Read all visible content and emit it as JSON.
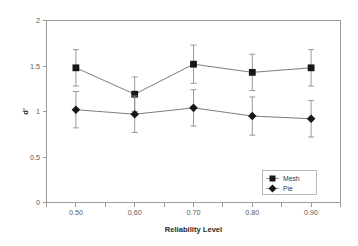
{
  "chart_data": {
    "type": "line",
    "title": "",
    "subtitle": "",
    "xlabel": "Reliability Level",
    "ylabel": "d'",
    "categories": [
      "0.50",
      "0.60",
      "0.70",
      "0.80",
      "0.90"
    ],
    "x": [
      0.5,
      0.6,
      0.7,
      0.8,
      0.9
    ],
    "xlim": [
      0.45,
      0.95
    ],
    "ylim": [
      0,
      2
    ],
    "yticks": [
      "0",
      "0.5",
      "1",
      "1.5",
      "2"
    ],
    "ytick_values": [
      0,
      0.5,
      1,
      1.5,
      2
    ],
    "xticks": [
      "0.50",
      "0.60",
      "0.70",
      "0.80",
      "0.90"
    ],
    "grid": false,
    "legend_position": "bottom-right",
    "error_bars": "symmetric standard error",
    "series": [
      {
        "name": "Mesh",
        "marker": "square",
        "values": [
          1.48,
          1.19,
          1.52,
          1.43,
          1.48
        ],
        "errors": [
          0.2,
          0.19,
          0.21,
          0.2,
          0.2
        ]
      },
      {
        "name": "Pie",
        "marker": "diamond",
        "values": [
          1.02,
          0.97,
          1.04,
          0.95,
          0.92
        ],
        "errors": [
          0.2,
          0.2,
          0.2,
          0.21,
          0.2
        ]
      }
    ]
  },
  "legend": {
    "entries": [
      {
        "label": "Mesh",
        "marker": "square"
      },
      {
        "label": "Pie",
        "marker": "diamond"
      }
    ]
  },
  "colors": {
    "axis": "#9a9a9a",
    "marker": "#171717",
    "line": "#6e6e6e",
    "errorbar": "#8d8d8d",
    "text": "#3a3a3a",
    "background": "#ffffff"
  }
}
